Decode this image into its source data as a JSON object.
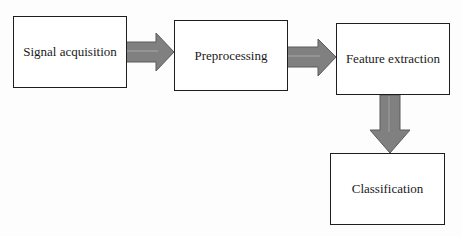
{
  "diagram": {
    "type": "flowchart",
    "direction": "left-to-right then down",
    "nodes": [
      {
        "id": "n1",
        "label": "Signal acquisition"
      },
      {
        "id": "n2",
        "label": "Preprocessing"
      },
      {
        "id": "n3",
        "label": "Feature extraction"
      },
      {
        "id": "n4",
        "label": "Classification"
      }
    ],
    "edges": [
      {
        "from": "n1",
        "to": "n2"
      },
      {
        "from": "n2",
        "to": "n3"
      },
      {
        "from": "n3",
        "to": "n4"
      }
    ],
    "colors": {
      "box_border": "#1e1e1e",
      "box_fill": "#ffffff",
      "arrow_fill": "#808080",
      "arrow_stroke": "#5a5a5a",
      "background": "#fdfdfd"
    }
  }
}
